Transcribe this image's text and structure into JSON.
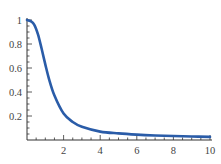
{
  "chart_data": {
    "type": "line",
    "title": "",
    "xlabel": "",
    "ylabel": "",
    "xlim": [
      0,
      10
    ],
    "ylim": [
      0,
      1
    ],
    "grid": false,
    "legend": null,
    "x_ticks": [
      "2",
      "4",
      "6",
      "8",
      "10"
    ],
    "y_ticks": [
      "0.2",
      "0.4",
      "0.6",
      "0.8",
      "1"
    ],
    "series": [
      {
        "name": "curve",
        "color": "#2a5ca8",
        "x": [
          0,
          0.2,
          0.4,
          0.6,
          0.8,
          1.0,
          1.2,
          1.5,
          2.0,
          2.5,
          3.0,
          4.0,
          5.0,
          6.0,
          7.0,
          8.0,
          9.0,
          10.0
        ],
        "y": [
          1.0,
          0.99,
          0.96,
          0.88,
          0.76,
          0.63,
          0.51,
          0.37,
          0.22,
          0.15,
          0.11,
          0.07,
          0.055,
          0.045,
          0.038,
          0.033,
          0.029,
          0.026
        ]
      }
    ]
  }
}
